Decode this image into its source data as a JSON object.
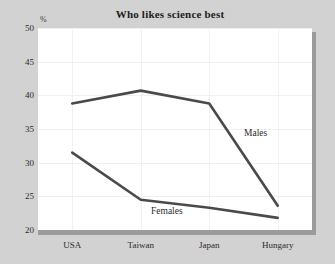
{
  "chart_data": {
    "type": "line",
    "title": "Who likes science best",
    "xlabel": "",
    "ylabel": "%",
    "unit_label": "%",
    "categories": [
      "USA",
      "Taiwan",
      "Japan",
      "Hungary"
    ],
    "ylim": [
      20,
      50
    ],
    "yticks": [
      50,
      45,
      40,
      35,
      30,
      25,
      20
    ],
    "grid": true,
    "legend_position": "inline-annotation",
    "series": [
      {
        "name": "Males",
        "values": [
          38.8,
          40.7,
          38.8,
          23.6
        ],
        "color": "#4a4a4a"
      },
      {
        "name": "Females",
        "values": [
          31.5,
          24.5,
          23.3,
          21.8
        ],
        "color": "#4a4a4a"
      }
    ],
    "annotations": [
      {
        "text": "Males",
        "series": "Males"
      },
      {
        "text": "Females",
        "series": "Females"
      }
    ]
  },
  "colors": {
    "page_background": "#d2d2d2",
    "plot_background": "#ffffff",
    "line": "#4a4a4a",
    "shadow": "#9b9b9b",
    "gridline": "#f1f1f1",
    "text": "#2b2b2b"
  }
}
